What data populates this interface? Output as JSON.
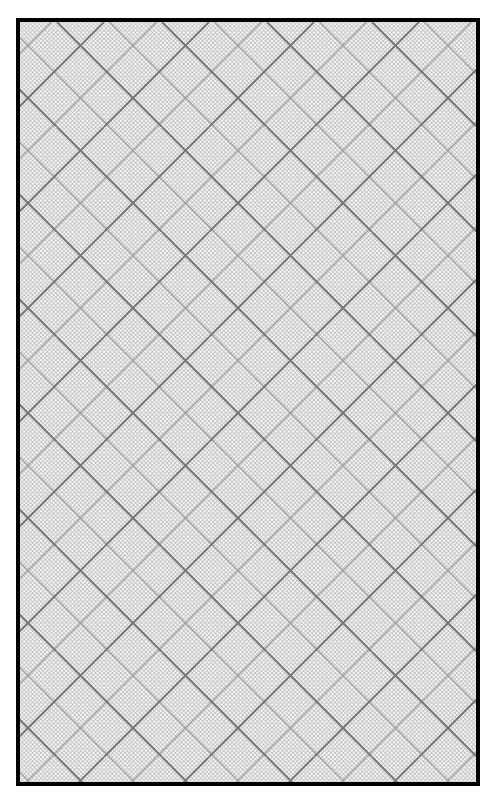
{
  "canvas": {
    "width": 490,
    "height": 803,
    "background": "#ffffff"
  },
  "frame": {
    "border_color": "#000000",
    "border_width": 4
  },
  "grid": {
    "pattern": "diagonal-crosshatch",
    "angle_degrees": 45,
    "major_line_color": "#777777",
    "medium_line_color": "#9a9a9a",
    "fine_line_color": "#bdbdbd",
    "major_spacing_px": 105,
    "medium_spacing_px": 52.5,
    "fine_spacing_px": 4.2
  }
}
